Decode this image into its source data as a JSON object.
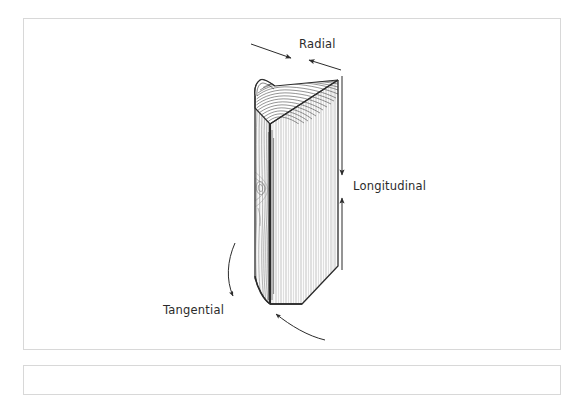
{
  "figure": {
    "title": "",
    "background_color": "#ffffff",
    "frame_border_color": "#d8d8d8",
    "ink_color": "#2b2b2b"
  },
  "labels": {
    "radial": "Radial",
    "longitudinal": "Longitudinal",
    "tangential": "Tangential"
  },
  "annotations": [
    {
      "name": "radial",
      "text": "Radial",
      "arrow_style": "double-headed-inward",
      "orientation": "diagonal-along-top-face",
      "x": 296,
      "y": 46
    },
    {
      "name": "longitudinal",
      "text": "Longitudinal",
      "arrow_style": "double-headed-inward",
      "orientation": "vertical",
      "x": 349,
      "y": 185
    },
    {
      "name": "tangential",
      "text": "Tangential",
      "arrow_style": "curved-pair",
      "orientation": "around-block",
      "x": 172,
      "y": 311
    }
  ],
  "block": {
    "name": "wood-block",
    "faces": [
      {
        "name": "top-face",
        "pattern": "growth-ring-arcs",
        "ring_count": 17
      },
      {
        "name": "front-left-face",
        "pattern": "wavy-tangential-grain",
        "has_knot": true
      },
      {
        "name": "right-face",
        "pattern": "straight-radial-grain"
      }
    ]
  }
}
